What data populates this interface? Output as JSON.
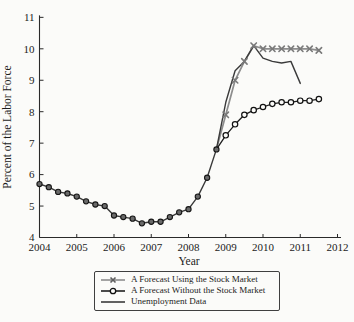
{
  "figure": {
    "background_color": "#fbfbf9",
    "axis_color": "#2a2a2a",
    "text_color": "#1b1b1b"
  },
  "legend": {
    "items": [
      {
        "label": "A Forecast Using the Stock Market",
        "marker": "x-marker",
        "line_color": "#8d8d8d",
        "marker_color": "#5f5f5f"
      },
      {
        "label": "A Forecast Without the Stock Market",
        "marker": "open-circle",
        "line_color": "#1f1f1f",
        "marker_color": "#111111"
      },
      {
        "label": "Unemployment Data",
        "marker": "plain-line",
        "line_color": "#3a3a3a",
        "marker_color": "#3a3a3a"
      }
    ]
  },
  "chart_data": {
    "type": "line",
    "title": "",
    "xlabel": "Year",
    "ylabel": "Percent of the Labor Force",
    "xlim": [
      2004,
      2012.1
    ],
    "ylim": [
      4,
      11
    ],
    "x_ticks": [
      2004,
      2005,
      2006,
      2007,
      2008,
      2009,
      2010,
      2011,
      2012
    ],
    "y_ticks": [
      4,
      5,
      6,
      7,
      8,
      9,
      10,
      11
    ],
    "grid": false,
    "legend_position": "bottom-center",
    "series": [
      {
        "name": "A Forecast Using the Stock Market",
        "color": "#8d8d8d",
        "line_width": 1.7,
        "marker": "x",
        "marker_color": "#7a7a7a",
        "marker_start": 2009.0,
        "x": [
          2008.75,
          2009.0,
          2009.25,
          2009.5,
          2009.75,
          2010.0,
          2010.25,
          2010.5,
          2010.75,
          2011.0,
          2011.25,
          2011.5
        ],
        "values": [
          6.8,
          7.9,
          9.0,
          9.6,
          10.1,
          10.0,
          10.0,
          10.0,
          10.0,
          10.0,
          10.0,
          9.95
        ]
      },
      {
        "name": "Unemployment Data",
        "color": "#3a3a3a",
        "line_width": 1.4,
        "marker": "circle-filled",
        "marker_color": "#6a6a6a",
        "marker_end": 2008.75,
        "x": [
          2004.0,
          2004.25,
          2004.5,
          2004.75,
          2005.0,
          2005.25,
          2005.5,
          2005.75,
          2006.0,
          2006.25,
          2006.5,
          2006.75,
          2007.0,
          2007.25,
          2007.5,
          2007.75,
          2008.0,
          2008.25,
          2008.5,
          2008.75,
          2009.0,
          2009.25,
          2009.5,
          2009.75,
          2010.0,
          2010.25,
          2010.5,
          2010.75,
          2011.0
        ],
        "values": [
          5.7,
          5.6,
          5.45,
          5.4,
          5.3,
          5.15,
          5.05,
          5.0,
          4.7,
          4.65,
          4.6,
          4.45,
          4.5,
          4.5,
          4.65,
          4.8,
          4.9,
          5.3,
          5.9,
          6.8,
          8.3,
          9.3,
          9.6,
          10.1,
          9.7,
          9.6,
          9.55,
          9.6,
          8.9
        ]
      },
      {
        "name": "A Forecast Without the Stock Market",
        "color": "#1f1f1f",
        "line_width": 1.3,
        "marker": "circle-open",
        "marker_color": "#111111",
        "marker_start": 2009.0,
        "x": [
          2008.75,
          2009.0,
          2009.25,
          2009.5,
          2009.75,
          2010.0,
          2010.25,
          2010.5,
          2010.75,
          2011.0,
          2011.25,
          2011.5
        ],
        "values": [
          6.8,
          7.25,
          7.6,
          7.9,
          8.05,
          8.15,
          8.25,
          8.3,
          8.3,
          8.35,
          8.35,
          8.4
        ]
      }
    ]
  }
}
